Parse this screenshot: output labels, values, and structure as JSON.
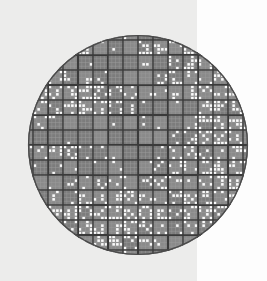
{
  "view": {
    "title": "Wafer Defect Bitmap Map",
    "width": 267,
    "height": 281,
    "background_left_color": "#ececeb",
    "background_right_color": "#fdfdfd",
    "background_split_x": 197
  },
  "wafer": {
    "name": "wafer-map",
    "center_x": 138,
    "center_y": 145,
    "radius": 110,
    "die_fill_color": "#8a8a8a",
    "die_fill_color_alt": "#7c7c7c",
    "die_border_color": "#3a3a3a",
    "cell_grid_color": "#9a9a9a",
    "defect_dot_color": "#fafafa",
    "edge_ring_color": "#4a4a4a",
    "die_size_px": 15,
    "cells_per_die": 4,
    "dot_size_px": 2.6,
    "grid_origin_x": 18,
    "grid_origin_y": 25,
    "columns": 16,
    "rows": 16
  },
  "chart_data": {
    "type": "heatmap",
    "xlabel": "Die Column",
    "ylabel": "Die Row",
    "grid": true,
    "legend": [],
    "die_columns": 16,
    "die_rows": 16,
    "cells_per_die_x": 4,
    "cells_per_die_y": 4,
    "dots_per_die": [
      [
        0,
        0,
        0,
        0,
        0,
        2,
        4,
        1,
        0,
        6,
        9,
        3,
        0,
        0,
        0,
        0
      ],
      [
        0,
        0,
        3,
        6,
        6,
        2,
        1,
        0,
        8,
        6,
        3,
        7,
        4,
        0,
        0,
        0
      ],
      [
        0,
        2,
        4,
        1,
        1,
        0,
        0,
        0,
        2,
        0,
        5,
        8,
        6,
        2,
        0,
        0
      ],
      [
        0,
        6,
        5,
        4,
        3,
        3,
        0,
        0,
        0,
        5,
        6,
        4,
        2,
        6,
        4,
        0
      ],
      [
        4,
        8,
        6,
        6,
        8,
        8,
        5,
        4,
        1,
        2,
        3,
        6,
        5,
        4,
        6,
        0
      ],
      [
        2,
        6,
        4,
        6,
        8,
        6,
        7,
        3,
        1,
        0,
        1,
        0,
        6,
        8,
        7,
        2
      ],
      [
        3,
        4,
        2,
        0,
        0,
        0,
        1,
        0,
        2,
        1,
        0,
        4,
        8,
        6,
        8,
        4
      ],
      [
        0,
        0,
        0,
        1,
        0,
        0,
        0,
        0,
        0,
        0,
        3,
        6,
        6,
        8,
        5,
        3
      ],
      [
        1,
        3,
        6,
        8,
        3,
        2,
        1,
        0,
        0,
        2,
        4,
        6,
        4,
        2,
        6,
        4
      ],
      [
        0,
        1,
        2,
        1,
        0,
        1,
        2,
        0,
        1,
        3,
        5,
        4,
        6,
        8,
        6,
        2
      ],
      [
        2,
        0,
        1,
        3,
        2,
        4,
        3,
        2,
        4,
        6,
        3,
        1,
        4,
        6,
        8,
        5
      ],
      [
        0,
        2,
        3,
        2,
        6,
        4,
        5,
        6,
        4,
        2,
        6,
        8,
        6,
        4,
        3,
        0
      ],
      [
        0,
        4,
        6,
        8,
        6,
        6,
        8,
        6,
        8,
        6,
        4,
        6,
        8,
        6,
        4,
        0
      ],
      [
        0,
        0,
        3,
        6,
        8,
        6,
        4,
        8,
        6,
        3,
        2,
        4,
        6,
        3,
        0,
        0
      ],
      [
        0,
        0,
        0,
        2,
        4,
        6,
        8,
        6,
        4,
        2,
        0,
        1,
        0,
        0,
        0,
        0
      ],
      [
        0,
        0,
        0,
        0,
        0,
        2,
        3,
        2,
        0,
        0,
        0,
        0,
        0,
        0,
        0,
        0
      ]
    ]
  }
}
